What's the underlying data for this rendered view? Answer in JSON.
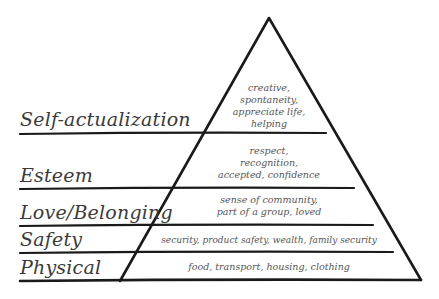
{
  "diagram": {
    "type": "pyramid",
    "line_color": "#1a1a1a",
    "text_color": "#3a3a3a",
    "levels": [
      {
        "label": "Self-actualization",
        "description_lines": [
          "creative,",
          "spontaneity,",
          "appreciate life,",
          "helping"
        ]
      },
      {
        "label": "Esteem",
        "description_lines": [
          "respect,",
          "recognition,",
          "accepted, confidence"
        ]
      },
      {
        "label": "Love/Belonging",
        "description_lines": [
          "sense of community,",
          "part of a group, loved"
        ]
      },
      {
        "label": "Safety",
        "description_lines": [
          "security, product safety, wealth, family security"
        ]
      },
      {
        "label": "Physical",
        "description_lines": [
          "food, transport, housing, clothing"
        ]
      }
    ]
  }
}
